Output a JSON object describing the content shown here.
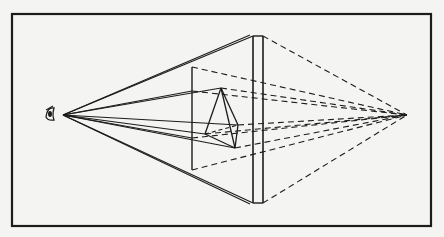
{
  "diagram": {
    "title": "",
    "type": "perspective-projection",
    "colors": {
      "background": "#f4f4f2",
      "ink": "#1c1c1c"
    },
    "frame": {
      "x": 12,
      "y": 14,
      "width": 419,
      "height": 212
    },
    "eye": {
      "label": "eye-icon",
      "x": 50,
      "y": 114,
      "station_point": [
        63,
        115
      ]
    },
    "vanishing_point": [
      407,
      115
    ],
    "picture_plane": {
      "slab_left_x": 253,
      "slab_right_x": 263,
      "top_y": 36,
      "bottom_y": 203,
      "inner_screen": {
        "x": 192,
        "top_y": 67,
        "bottom_y": 170
      }
    },
    "object": {
      "name": "pyramid",
      "apex": [
        221,
        88
      ],
      "base_left": [
        205,
        134
      ],
      "base_right": [
        238,
        125
      ],
      "base_bottom": [
        235,
        148
      ]
    },
    "visual_rays_solid": [
      [
        [
          63,
          115
        ],
        [
          253,
          36
        ]
      ],
      [
        [
          63,
          115
        ],
        [
          250,
          35
        ]
      ],
      [
        [
          63,
          115
        ],
        [
          253,
          203
        ]
      ],
      [
        [
          63,
          115
        ],
        [
          250,
          204
        ]
      ],
      [
        [
          63,
          115
        ],
        [
          221,
          88
        ]
      ],
      [
        [
          63,
          115
        ],
        [
          192,
          91
        ]
      ],
      [
        [
          63,
          115
        ],
        [
          238,
          125
        ]
      ],
      [
        [
          63,
          115
        ],
        [
          205,
          134
        ]
      ],
      [
        [
          63,
          115
        ],
        [
          235,
          148
        ]
      ],
      [
        [
          63,
          115
        ],
        [
          192,
          138
        ]
      ]
    ],
    "projectors_dashed": [
      [
        [
          263,
          36
        ],
        [
          407,
          115
        ]
      ],
      [
        [
          263,
          203
        ],
        [
          407,
          115
        ]
      ],
      [
        [
          192,
          67
        ],
        [
          407,
          115
        ]
      ],
      [
        [
          192,
          170
        ],
        [
          407,
          115
        ]
      ],
      [
        [
          221,
          88
        ],
        [
          407,
          115
        ]
      ],
      [
        [
          238,
          125
        ],
        [
          407,
          115
        ]
      ],
      [
        [
          205,
          134
        ],
        [
          407,
          115
        ]
      ],
      [
        [
          235,
          148
        ],
        [
          407,
          115
        ]
      ],
      [
        [
          192,
          91
        ],
        [
          407,
          115
        ]
      ],
      [
        [
          192,
          138
        ],
        [
          407,
          115
        ]
      ]
    ]
  }
}
